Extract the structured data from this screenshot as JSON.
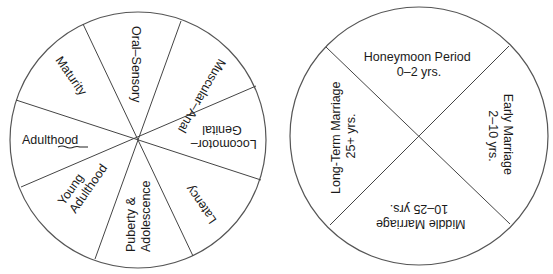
{
  "diagram": {
    "left_wheel": {
      "name": "Life Stages Wheel",
      "center": [
        138,
        140
      ],
      "radius": 128,
      "sectors": [
        {
          "id": "oral-sensory",
          "lines": [
            "Oral–Sensory"
          ]
        },
        {
          "id": "muscular-anal",
          "lines": [
            "Muscular–Anal"
          ]
        },
        {
          "id": "locomotor-genital",
          "lines": [
            "Locomotor–",
            "Genital"
          ]
        },
        {
          "id": "latency",
          "lines": [
            "Latency"
          ]
        },
        {
          "id": "puberty-adolescence",
          "lines": [
            "Puberty &",
            "Adolescence"
          ]
        },
        {
          "id": "young-adulthood",
          "lines": [
            "Young",
            "Adulthood"
          ]
        },
        {
          "id": "adulthood",
          "lines": [
            "Adulthood"
          ]
        },
        {
          "id": "maturity",
          "lines": [
            "Maturity"
          ]
        }
      ]
    },
    "right_wheel": {
      "name": "Marriage Stages Wheel",
      "center": [
        419,
        136
      ],
      "radius": 129,
      "sectors": [
        {
          "id": "honeymoon",
          "lines": [
            "Honeymoon Period",
            "0–2 yrs."
          ]
        },
        {
          "id": "early-marriage",
          "lines": [
            "Early Marriage",
            "2–10 yrs."
          ]
        },
        {
          "id": "middle-marriage",
          "lines": [
            "Middle Marriage",
            "10–25 yrs."
          ]
        },
        {
          "id": "long-term-marriage",
          "lines": [
            "Long-Term Marriage",
            "25+ yrs."
          ]
        }
      ]
    },
    "colors": {
      "background": "#ffffff",
      "stroke": "#555555",
      "text": "#1a1a1a",
      "scribble": "#222222"
    }
  }
}
